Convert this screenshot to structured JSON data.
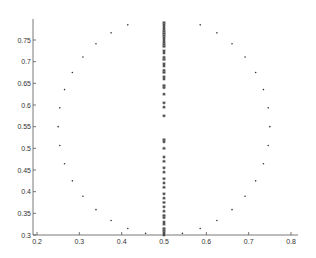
{
  "chart_data": {
    "type": "scatter",
    "title": "",
    "xlabel": "",
    "ylabel": "",
    "xlim": [
      0.2,
      0.8
    ],
    "ylim": [
      0.3,
      0.79
    ],
    "grid": false,
    "legend": null,
    "x_ticks": [
      0.2,
      0.3,
      0.4,
      0.5,
      0.6,
      0.7,
      0.8
    ],
    "x_tick_labels": [
      "0.2",
      "0.3",
      "0.4",
      "0.5",
      "0.6",
      "0.7",
      "0.8"
    ],
    "y_ticks": [
      0.3,
      0.35,
      0.4,
      0.45,
      0.5,
      0.55,
      0.6,
      0.65,
      0.7,
      0.75
    ],
    "y_tick_labels": [
      "0.3",
      "0.35",
      "0.4",
      "0.45",
      "0.5",
      "0.55",
      "0.6",
      "0.65",
      "0.7",
      "0.75"
    ],
    "series": [
      {
        "name": "circle",
        "marker": "dot",
        "description": "points on a circle centered (0.5, 0.55), radius 0.25, every 10 degrees",
        "center": [
          0.5,
          0.55
        ],
        "radius": 0.25,
        "n_points": 36
      },
      {
        "name": "column",
        "marker": "star",
        "x": 0.5,
        "y": [
          0.79,
          0.785,
          0.78,
          0.775,
          0.77,
          0.765,
          0.76,
          0.755,
          0.75,
          0.745,
          0.74,
          0.735,
          0.725,
          0.72,
          0.71,
          0.705,
          0.695,
          0.69,
          0.68,
          0.675,
          0.665,
          0.66,
          0.645,
          0.64,
          0.625,
          0.605,
          0.595,
          0.575,
          0.52,
          0.515,
          0.5,
          0.48,
          0.47,
          0.455,
          0.445,
          0.43,
          0.42,
          0.41,
          0.395,
          0.385,
          0.375,
          0.365,
          0.355,
          0.345,
          0.34,
          0.33,
          0.325,
          0.315,
          0.31,
          0.305,
          0.3
        ]
      }
    ]
  },
  "plot_area": {
    "left_px": 33,
    "right_px": 298,
    "top_px": 19,
    "bottom_px": 235,
    "x_min_px_value": 0.19,
    "x_max_px_value": 0.815,
    "y_bottom_value": 0.3,
    "y_top_value": 0.8
  }
}
